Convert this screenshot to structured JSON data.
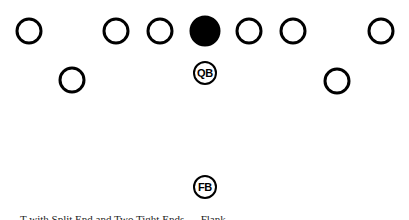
{
  "diagram": {
    "type": "football-formation",
    "line_of_scrimmage": {
      "players": [
        {
          "role": "split-end",
          "label": ""
        },
        {
          "role": "tackle",
          "label": ""
        },
        {
          "role": "guard",
          "label": ""
        },
        {
          "role": "center",
          "label": "",
          "filled": true
        },
        {
          "role": "guard",
          "label": ""
        },
        {
          "role": "tackle",
          "label": ""
        },
        {
          "role": "end",
          "label": ""
        }
      ]
    },
    "backfield": {
      "players": [
        {
          "role": "wingback-left",
          "label": ""
        },
        {
          "role": "quarterback",
          "label": "QB"
        },
        {
          "role": "wingback-right",
          "label": ""
        },
        {
          "role": "fullback",
          "label": "FB"
        }
      ]
    },
    "colors": {
      "stroke": "#000000",
      "center_fill": "#000000",
      "background": "#ffffff"
    }
  },
  "caption": "T with Split End and Two Tight Ends — Flank"
}
